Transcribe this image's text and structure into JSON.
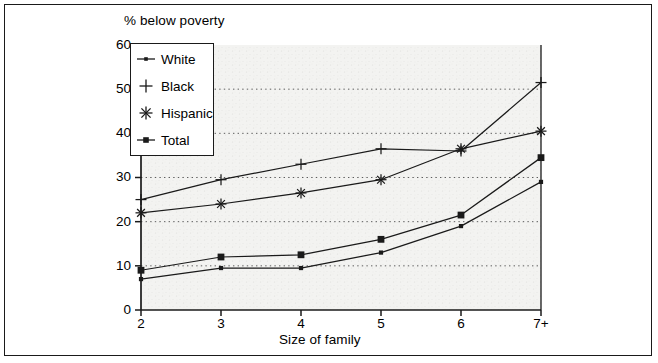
{
  "chart_data": {
    "type": "line",
    "title": "",
    "ylabel": "% below poverty",
    "xlabel": "Size of family",
    "categories": [
      "2",
      "3",
      "4",
      "5",
      "6",
      "7+"
    ],
    "ylim": [
      0,
      60
    ],
    "yticks": [
      0,
      10,
      20,
      30,
      40,
      50,
      60
    ],
    "grid": true,
    "grid_style": "dotted-horizontal",
    "legend_position": "top-left-inside",
    "series": [
      {
        "name": "White",
        "marker": "small-dot",
        "values": [
          7,
          9.5,
          9.5,
          13,
          19,
          29
        ]
      },
      {
        "name": "Black",
        "marker": "plus",
        "values": [
          25,
          29.5,
          33,
          36.5,
          36,
          51.5
        ]
      },
      {
        "name": "Hispanic",
        "marker": "asterisk",
        "values": [
          22,
          24,
          26.5,
          29.5,
          36.5,
          40.5
        ]
      },
      {
        "name": "Total",
        "marker": "filled-square",
        "values": [
          9,
          12,
          12.5,
          16,
          21.5,
          34.5
        ]
      }
    ]
  },
  "axes": {
    "y_title": "% below poverty",
    "x_title": "Size of family",
    "y_tick_labels": [
      "60",
      "50",
      "40",
      "30",
      "20",
      "10",
      "0"
    ],
    "x_tick_labels": [
      "2",
      "3",
      "4",
      "5",
      "6",
      "7+"
    ]
  },
  "legend": {
    "entries": [
      {
        "label": "White",
        "marker": "small-dot-marker"
      },
      {
        "label": "Black",
        "marker": "plus-marker"
      },
      {
        "label": "Hispanic",
        "marker": "asterisk-marker"
      },
      {
        "label": "Total",
        "marker": "filled-square-marker"
      }
    ]
  },
  "colors": {
    "line": "#1a1a1a",
    "frame": "#1a1a1a",
    "plot_background": "#f2f2f2",
    "page_background": "#ffffff"
  }
}
